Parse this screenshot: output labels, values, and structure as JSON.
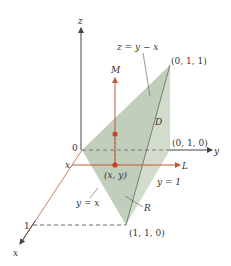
{
  "figure": {
    "type": "3D region diagram",
    "axes": {
      "x_label": "x",
      "y_label": "y",
      "z_label": "z",
      "origin_label": "0",
      "x_tick_label": "1"
    },
    "plane": {
      "equation": "z = y − x"
    },
    "points": {
      "top": "(0, 1, 1)",
      "y_axis_point": "(0, 1, 0)",
      "base_corner": "(1, 1, 0)",
      "sample_point": "(x, y)"
    },
    "region_labels": {
      "solid": "D",
      "base": "R"
    },
    "lines": {
      "vertical": "M",
      "horizontal": "L",
      "x_start": "x",
      "boundary_diag": "y = x",
      "boundary_y1": "y = 1"
    },
    "colors": {
      "axis": "#444444",
      "red_line": "#c0583a",
      "point": "#c8431e",
      "plane_fill": "#b9c9b4",
      "solid_fill": "#d3dccc"
    }
  }
}
